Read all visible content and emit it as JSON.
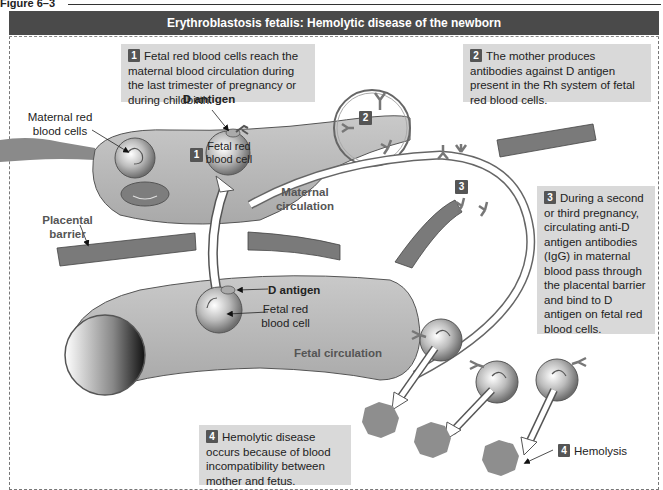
{
  "figure": {
    "label": "Figure 6–3",
    "title": "Erythroblastosis fetalis:  Hemolytic disease of the newborn"
  },
  "steps": [
    {
      "number": "1",
      "text": "Fetal red blood cells reach the maternal blood circulation during the last trimester of pregnancy or during childbirth."
    },
    {
      "number": "2",
      "text": "The mother produces antibodies against  D antigen present in the Rh system of fetal red blood cells."
    },
    {
      "number": "3",
      "text": "During a second or third pregnancy, circulating anti-D antigen antibodies (IgG) in maternal blood pass through the placental barrier and bind to D antigen on fetal red blood cells."
    },
    {
      "number": "4",
      "text": "Hemolytic disease occurs because of blood incompatibility between mother and fetus."
    }
  ],
  "labels": {
    "maternal_rbc_line1": "Maternal red",
    "maternal_rbc_line2": "blood cells",
    "d_antigen_top": "D antigen",
    "fetal_rbc_top_line1": "Fetal red",
    "fetal_rbc_top_line2": "blood cell",
    "maternal_circulation_line1": "Maternal",
    "maternal_circulation_line2": "circulation",
    "placental_barrier_line1": "Placental",
    "placental_barrier_line2": "barrier",
    "d_antigen_bottom": "D antigen",
    "fetal_rbc_bottom_line1": "Fetal red",
    "fetal_rbc_bottom_line2": "blood cell",
    "fetal_circulation": "Fetal circulation",
    "hemolysis": "Hemolysis"
  },
  "badges": {
    "b1": "1",
    "b2": "2",
    "b3": "3",
    "b4": "4"
  },
  "colors": {
    "header_bar": "#4a4a4a",
    "note_bg": "#d9d9d9",
    "vessel_fill": "#bdbdbd",
    "barrier_fill": "#7a7a7a",
    "badge_bg": "#555555",
    "lysed_cell": "#8e8e8e"
  }
}
